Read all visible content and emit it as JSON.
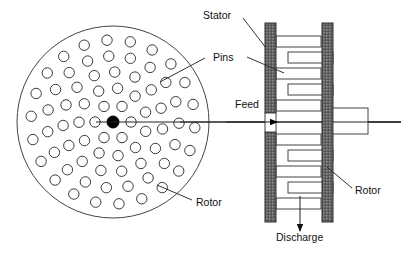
{
  "diagram": {
    "canvas": {
      "width": 401,
      "height": 255,
      "background": "#ffffff"
    },
    "labels": {
      "stator": "Stator",
      "pins": "Pins",
      "feed": "Feed",
      "discharge": "Discharge",
      "rotor_front": "Rotor",
      "rotor_side": "Rotor"
    },
    "colors": {
      "outline": "#444444",
      "hatch": "#6b6b6b",
      "hub": "#000000",
      "text": "#111111",
      "background": "#ffffff"
    },
    "front_view": {
      "name": "rotor-disc-front-view",
      "center": {
        "x": 113,
        "y": 122
      },
      "radius": 96,
      "hub_radius": 6,
      "pin_radius": 5.2,
      "pin_rings": [
        {
          "ring_radius": 18,
          "count": 6,
          "angle_offset": 0
        },
        {
          "ring_radius": 34,
          "count": 11,
          "angle_offset": 16
        },
        {
          "ring_radius": 50,
          "count": 15,
          "angle_offset": 8
        },
        {
          "ring_radius": 66,
          "count": 19,
          "angle_offset": 20
        },
        {
          "ring_radius": 82,
          "count": 22,
          "angle_offset": 4
        }
      ],
      "shaft_line": {
        "x1": 96,
        "x2": 401,
        "y": 122
      }
    },
    "side_view": {
      "name": "pin-mill-side-view",
      "stator_bar": {
        "x": 265,
        "y": 23,
        "width": 11,
        "height": 199
      },
      "rotor_bar": {
        "x": 322,
        "y": 23,
        "width": 11,
        "height": 199
      },
      "feed_gap": {
        "x": 265,
        "y": 113,
        "width": 11,
        "height": 19
      },
      "hub_block": {
        "x": 333,
        "y": 108,
        "width": 35,
        "height": 26
      },
      "shaft_line": {
        "x1": 180,
        "x2": 401,
        "y": 122
      },
      "pin_bars_upper": [
        {
          "x": 276,
          "y": 36,
          "width": 45,
          "height": 11,
          "anchor": "stator"
        },
        {
          "x": 288,
          "y": 52,
          "width": 45,
          "height": 11,
          "anchor": "rotor"
        },
        {
          "x": 276,
          "y": 68,
          "width": 45,
          "height": 11,
          "anchor": "stator"
        },
        {
          "x": 288,
          "y": 84,
          "width": 45,
          "height": 11,
          "anchor": "rotor"
        },
        {
          "x": 276,
          "y": 100,
          "width": 45,
          "height": 11,
          "anchor": "stator"
        }
      ],
      "pin_bars_lower": [
        {
          "x": 276,
          "y": 134,
          "width": 45,
          "height": 11,
          "anchor": "stator"
        },
        {
          "x": 288,
          "y": 150,
          "width": 45,
          "height": 11,
          "anchor": "rotor"
        },
        {
          "x": 276,
          "y": 166,
          "width": 45,
          "height": 11,
          "anchor": "stator"
        },
        {
          "x": 288,
          "y": 182,
          "width": 45,
          "height": 11,
          "anchor": "rotor"
        },
        {
          "x": 276,
          "y": 198,
          "width": 45,
          "height": 11,
          "anchor": "stator"
        }
      ]
    },
    "annotations": {
      "stator_label_pos": {
        "x": 203,
        "y": 19
      },
      "stator_leader": {
        "x1": 243,
        "y1": 18,
        "x2": 266,
        "y2": 48
      },
      "pins_label_pos": {
        "x": 213,
        "y": 58
      },
      "pins_leader_right": {
        "x1": 247,
        "y1": 57,
        "x2": 284,
        "y2": 73
      },
      "pins_leader_left": {
        "x1": 205,
        "y1": 58,
        "x2": 160,
        "y2": 82
      },
      "feed_label_pos": {
        "x": 235,
        "y": 106
      },
      "feed_arrow": {
        "x1": 226,
        "y1": 122,
        "x2": 279,
        "y2": 122
      },
      "discharge_label_pos": {
        "x": 276,
        "y": 241
      },
      "discharge_arrow": {
        "x1": 300,
        "y1": 196,
        "x2": 300,
        "y2": 233
      },
      "rotor_front_label_pos": {
        "x": 196,
        "y": 204
      },
      "rotor_front_leader": {
        "x1": 192,
        "y1": 200,
        "x2": 157,
        "y2": 185
      },
      "rotor_side_label_pos": {
        "x": 355,
        "y": 192
      },
      "rotor_side_leader": {
        "x1": 352,
        "y1": 188,
        "x2": 327,
        "y2": 167
      }
    }
  }
}
